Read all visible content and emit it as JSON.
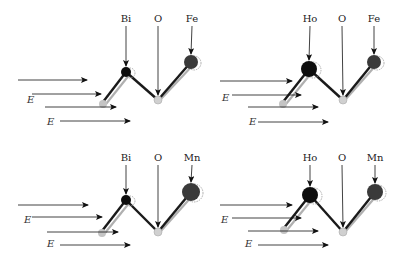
{
  "colors": {
    "bond": "#1a1a1a",
    "ghost_bond": "#b0b0b0",
    "atom_dark": "#0d0d0d",
    "atom_tm": "#3a3a3a",
    "atom_ghost": "#c4c4c4",
    "arrow": "#111111"
  },
  "field_label": "E",
  "panels": [
    {
      "id": "bi-fe",
      "atoms": {
        "a": "Bi",
        "o": "O",
        "b": "Fe"
      },
      "label_y": 22,
      "a_label_x": 126,
      "o_label_x": 158,
      "b_label_x": 192,
      "a_atom": {
        "x": 126,
        "y": 72,
        "r": 5
      },
      "o_atom": {
        "x": 158,
        "y": 100,
        "r": 4
      },
      "b_atom": {
        "x": 191,
        "y": 62,
        "r": 7
      },
      "ghost": {
        "x": 103,
        "y": 104,
        "r": 4
      },
      "arrows": [
        [
          18,
          87,
          80
        ],
        [
          32,
          101,
          94
        ],
        [
          45,
          116,
          107
        ],
        [
          60,
          130,
          121
        ]
      ],
      "e_labels": [
        [
          27,
          103
        ],
        [
          47,
          125
        ]
      ]
    },
    {
      "id": "ho-fe",
      "atoms": {
        "a": "Ho",
        "o": "O",
        "b": "Fe"
      },
      "label_y": 22,
      "a_label_x": 310,
      "o_label_x": 342,
      "b_label_x": 374,
      "a_atom": {
        "x": 309,
        "y": 69,
        "r": 8
      },
      "o_atom": {
        "x": 343,
        "y": 100,
        "r": 4
      },
      "b_atom": {
        "x": 374,
        "y": 62,
        "r": 7
      },
      "ghost": {
        "x": 283,
        "y": 104,
        "r": 4
      },
      "arrows": [
        [
          220,
          292,
          81
        ],
        [
          232,
          301,
          95
        ],
        [
          248,
          318,
          107
        ],
        [
          258,
          328,
          122
        ]
      ],
      "e_labels": [
        [
          222,
          101
        ],
        [
          249,
          125
        ]
      ]
    },
    {
      "id": "bi-mn",
      "atoms": {
        "a": "Bi",
        "o": "O",
        "b": "Mn"
      },
      "label_y": 161,
      "a_label_x": 126,
      "o_label_x": 158,
      "b_label_x": 192,
      "a_atom": {
        "x": 126,
        "y": 200,
        "r": 5
      },
      "o_atom": {
        "x": 158,
        "y": 232,
        "r": 4
      },
      "b_atom": {
        "x": 191,
        "y": 192,
        "r": 9
      },
      "ghost": {
        "x": 102,
        "y": 233,
        "r": 4
      },
      "arrows": [
        [
          18,
          88,
          205
        ],
        [
          32,
          102,
          217
        ],
        [
          47,
          118,
          232
        ],
        [
          60,
          130,
          245
        ]
      ],
      "e_labels": [
        [
          24,
          223
        ],
        [
          47,
          247
        ]
      ]
    },
    {
      "id": "ho-mn",
      "atoms": {
        "a": "Ho",
        "o": "O",
        "b": "Mn"
      },
      "label_y": 161,
      "a_label_x": 310,
      "o_label_x": 342,
      "b_label_x": 375,
      "a_atom": {
        "x": 310,
        "y": 195,
        "r": 8
      },
      "o_atom": {
        "x": 343,
        "y": 232,
        "r": 4
      },
      "b_atom": {
        "x": 375,
        "y": 192,
        "r": 8
      },
      "ghost": {
        "x": 284,
        "y": 230,
        "r": 4
      },
      "arrows": [
        [
          220,
          292,
          205
        ],
        [
          232,
          301,
          218
        ],
        [
          248,
          318,
          231
        ],
        [
          258,
          328,
          245
        ]
      ],
      "e_labels": [
        [
          221,
          223
        ],
        [
          245,
          247
        ]
      ]
    }
  ]
}
